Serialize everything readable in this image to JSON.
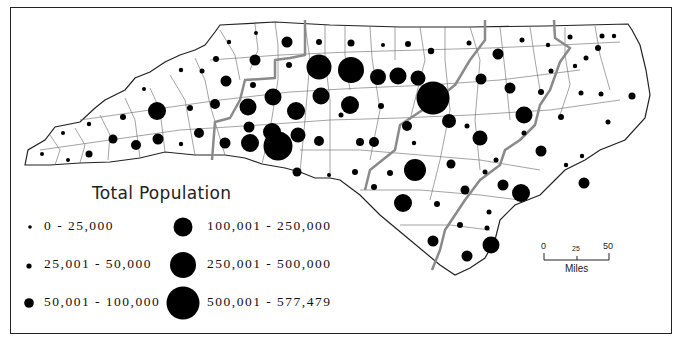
{
  "map": {
    "subject": "North Carolina counties",
    "legend": {
      "title": "Total Population",
      "classes": [
        {
          "label": "0 - 25,000",
          "radius": 1.8
        },
        {
          "label": "25,001 - 50,000",
          "radius": 2.6
        },
        {
          "label": "50,001 - 100,000",
          "radius": 4.5
        },
        {
          "label": "100,001 - 250,000",
          "radius": 9.5
        },
        {
          "label": "250,001 - 500,000",
          "radius": 13
        },
        {
          "label": "500,001 - 577,479",
          "radius": 16.5
        }
      ]
    },
    "scale_bar": {
      "ticks": [
        "0",
        "25",
        "50"
      ],
      "unit": "Miles"
    },
    "colors": {
      "symbol": "#000000",
      "county_border": "#555555",
      "region_border": "#8a8a8a",
      "state_outline": "#222222",
      "background": "#ffffff"
    }
  }
}
